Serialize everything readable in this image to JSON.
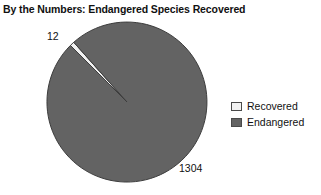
{
  "chart_data": {
    "type": "pie",
    "title": "By the Numbers: Endangered Species Recovered",
    "categories": [
      "Recovered",
      "Endangered"
    ],
    "values": [
      12,
      1304
    ],
    "labels": [
      "12",
      "1304"
    ],
    "total": 1316,
    "xlabel": "",
    "ylabel": "",
    "grid": false,
    "legend_position": "right",
    "slice_colors": [
      "#f2f2f2",
      "#636363"
    ],
    "slice_border_color": "#3d3d3d",
    "start_angle_deg": 135,
    "direction": "clockwise",
    "geometry": {
      "center_x": 127,
      "center_y": 102,
      "radius": 80
    }
  },
  "legend": {
    "items": [
      {
        "label": "Recovered",
        "color": "#f2f2f2"
      },
      {
        "label": "Endangered",
        "color": "#636363"
      }
    ]
  },
  "colors": {
    "background": "#ffffff",
    "text": "#111111",
    "recovered": "#f2f2f2",
    "endangered": "#636363",
    "outline": "#3d3d3d"
  }
}
